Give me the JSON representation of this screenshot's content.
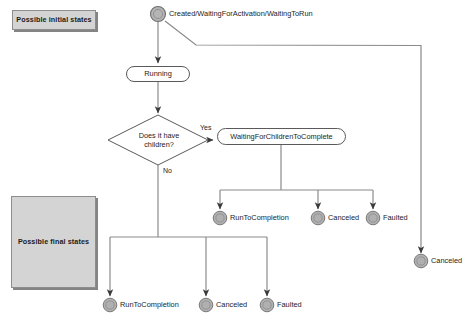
{
  "diagram": {
    "background_color": "#ffffff",
    "legend": {
      "initial": {
        "label": "Possible initial states",
        "fill": "#d4d4d4",
        "stroke": "#8d8d8d"
      },
      "final": {
        "label": "Possible final states",
        "fill": "#d4d4d4",
        "stroke": "#8d8d8d"
      }
    },
    "nodes": {
      "start": {
        "type": "start-state",
        "label": "Created/WaitingForActivation/WaitingToRun",
        "fill": "#b4b4b4",
        "stroke": "#6e6e6e"
      },
      "running": {
        "type": "state",
        "label": "Running"
      },
      "decision": {
        "type": "decision",
        "label_line1": "Does it have",
        "label_line2": "children?"
      },
      "waiting_for_children": {
        "type": "state",
        "label": "WaitingForChildrenToComplete"
      },
      "mid_run_to_completion": {
        "type": "final-state",
        "label": "RunToCompletion"
      },
      "mid_canceled": {
        "type": "final-state",
        "label": "Canceled"
      },
      "mid_faulted": {
        "type": "final-state",
        "label": "Faulted"
      },
      "right_canceled": {
        "type": "final-state",
        "label": "Canceled"
      },
      "bottom_run_to_completion": {
        "type": "final-state",
        "label": "RunToCompletion"
      },
      "bottom_canceled": {
        "type": "final-state",
        "label": "Canceled"
      },
      "bottom_faulted": {
        "type": "final-state",
        "label": "Faulted"
      }
    },
    "edge_labels": {
      "yes": "Yes",
      "no": "No"
    },
    "colors": {
      "line": "#8a8a8a",
      "arrow": "#3a3a3a",
      "node_fill": "#b0b0b0",
      "node_ring": "#7a7a7a",
      "text": "#1c1c1c"
    }
  }
}
